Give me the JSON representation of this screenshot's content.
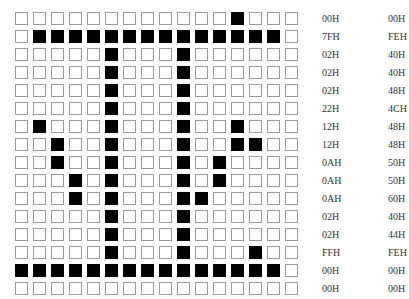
{
  "grid": {
    "rows": 16,
    "cols": 16,
    "filled": [
      [
        12
      ],
      [
        1,
        2,
        3,
        4,
        5,
        6,
        7,
        8,
        9,
        10,
        11,
        12,
        13,
        14
      ],
      [
        5,
        9
      ],
      [
        5,
        9
      ],
      [
        5,
        9
      ],
      [
        5,
        9
      ],
      [
        1,
        5,
        9,
        12
      ],
      [
        2,
        5,
        9,
        12,
        13
      ],
      [
        2,
        5,
        9,
        11
      ],
      [
        3,
        5,
        9,
        11
      ],
      [
        3,
        5,
        9,
        10
      ],
      [
        5,
        9
      ],
      [
        5,
        9
      ],
      [
        5,
        9,
        13
      ],
      [
        0,
        1,
        2,
        3,
        4,
        5,
        6,
        7,
        8,
        9,
        10,
        11,
        12,
        13,
        14
      ],
      []
    ]
  },
  "hex": [
    {
      "left": "00H",
      "right": "00H"
    },
    {
      "left": "7FH",
      "right": "FEH"
    },
    {
      "left": "02H",
      "right": "40H"
    },
    {
      "left": "02H",
      "right": "40H"
    },
    {
      "left": "02H",
      "right": "48H"
    },
    {
      "left": "22H",
      "right": "4CH"
    },
    {
      "left": "12H",
      "right": "48H"
    },
    {
      "left": "12H",
      "right": "48H"
    },
    {
      "left": "0AH",
      "right": "50H"
    },
    {
      "left": "0AH",
      "right": "50H"
    },
    {
      "left": "0AH",
      "right": "60H"
    },
    {
      "left": "02H",
      "right": "40H"
    },
    {
      "left": "02H",
      "right": "44H"
    },
    {
      "left": "FFH",
      "right": "FEH"
    },
    {
      "left": "00H",
      "right": "00H"
    },
    {
      "left": "00H",
      "right": "00H"
    }
  ],
  "colors": {
    "filled": "#000000",
    "empty": "#ffffff",
    "border": "#9a9a9a"
  }
}
